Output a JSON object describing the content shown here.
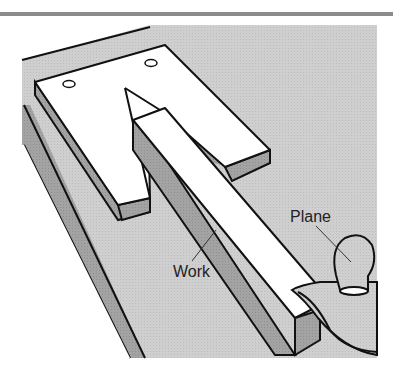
{
  "figure": {
    "labels": {
      "plane": "Plane",
      "work": "Work"
    },
    "colors": {
      "background_panel": "#c9c9c9",
      "top_rule": "#8c8c8c",
      "face_white": "#ffffff",
      "face_shadow": "#9e9e9e",
      "outline": "#111111"
    }
  }
}
